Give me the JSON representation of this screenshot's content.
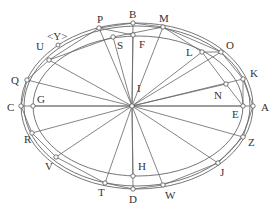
{
  "diagram": {
    "type": "geometric-construction",
    "colors": {
      "line": "#666666",
      "point_fill": "#ffffff",
      "point_stroke": "#555555",
      "label": "#333333"
    },
    "center": {
      "name": "I",
      "x": 132,
      "y": 106,
      "label_x": 137,
      "label_y": 92
    },
    "outer_ellipse": {
      "cx": 137,
      "cy": 106,
      "rx": 116,
      "ry": 83
    },
    "outer_ellipse_2": {
      "cx": 137,
      "cy": 106,
      "rx": 113,
      "ry": 80
    },
    "inner_ellipse": {
      "cx": 138,
      "cy": 106,
      "rx": 105,
      "ry": 70
    },
    "points": [
      {
        "name": "A",
        "x": 253,
        "y": 106,
        "lx": 261,
        "ly": 111
      },
      {
        "name": "K",
        "x": 243,
        "y": 79,
        "lx": 250,
        "ly": 77
      },
      {
        "name": "O",
        "x": 221,
        "y": 52,
        "lx": 226,
        "ly": 49
      },
      {
        "name": "M",
        "x": 163,
        "y": 27,
        "lx": 159,
        "ly": 22
      },
      {
        "name": "B",
        "x": 133,
        "y": 23,
        "lx": 129,
        "ly": 18
      },
      {
        "name": "P",
        "x": 99,
        "y": 28,
        "lx": 97,
        "ly": 23
      },
      {
        "name": "U",
        "x": 49,
        "y": 60,
        "lx": 36,
        "ly": 50
      },
      {
        "name": "Q",
        "x": 27,
        "y": 80,
        "lx": 11,
        "ly": 84
      },
      {
        "name": "C",
        "x": 21,
        "y": 106,
        "lx": 7,
        "ly": 111
      },
      {
        "name": "R",
        "x": 32,
        "y": 133,
        "lx": 24,
        "ly": 143
      },
      {
        "name": "V",
        "x": 56,
        "y": 157,
        "lx": 45,
        "ly": 170
      },
      {
        "name": "T",
        "x": 105,
        "y": 183,
        "lx": 98,
        "ly": 196
      },
      {
        "name": "D",
        "x": 133,
        "y": 189,
        "lx": 129,
        "ly": 203
      },
      {
        "name": "W",
        "x": 163,
        "y": 185,
        "lx": 165,
        "ly": 199
      },
      {
        "name": "J",
        "x": 218,
        "y": 163,
        "lx": 220,
        "ly": 176
      },
      {
        "name": "Z",
        "x": 243,
        "y": 137,
        "lx": 248,
        "ly": 146
      }
    ],
    "inner_points": [
      {
        "name": "F",
        "x": 133,
        "y": 35,
        "lx": 139,
        "ly": 48
      },
      {
        "name": "S",
        "x": 113,
        "y": 37,
        "lx": 117,
        "ly": 49
      },
      {
        "name": "L",
        "x": 202,
        "y": 52,
        "lx": 186,
        "ly": 56
      },
      {
        "name": "N",
        "x": 226,
        "y": 84,
        "lx": 214,
        "ly": 99
      },
      {
        "name": "E",
        "x": 243,
        "y": 106,
        "lx": 232,
        "ly": 118
      },
      {
        "name": "G",
        "x": 33,
        "y": 106,
        "lx": 37,
        "ly": 103
      },
      {
        "name": "H",
        "x": 133,
        "y": 176,
        "lx": 138,
        "ly": 170
      }
    ],
    "marker": {
      "name": "<Y>",
      "x": 58,
      "y": 45,
      "lx": 47,
      "ly": 40
    }
  }
}
